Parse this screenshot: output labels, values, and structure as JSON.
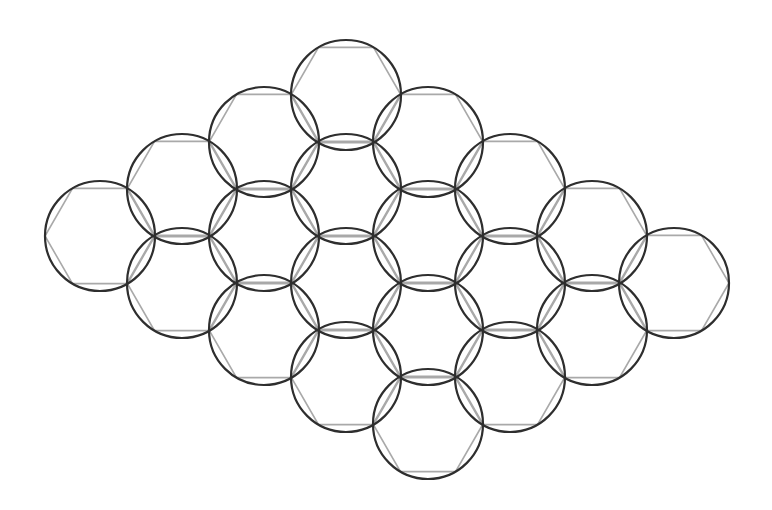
{
  "diagram": {
    "grid": {
      "columns": 4,
      "rows": 5,
      "origin": [
        100,
        236
      ],
      "step_a": [
        82,
        -47
      ],
      "step_b": [
        82,
        47
      ],
      "radius": 55
    },
    "colors": {
      "circle_stroke": "#2e2e2e",
      "hexagon_stroke": "#a9a9a9",
      "background": "#ffffff"
    },
    "cell_count": 20
  }
}
